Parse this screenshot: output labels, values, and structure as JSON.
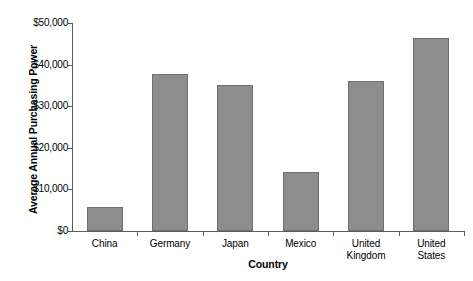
{
  "chart_data": {
    "type": "bar",
    "title": "",
    "subtitle": "",
    "xlabel": "Country",
    "ylabel": "Average Annual Purchasing Power",
    "categories": [
      "China",
      "Germany",
      "Japan",
      "Mexico",
      "United Kingdom",
      "United States"
    ],
    "values": [
      5800,
      37700,
      35000,
      14200,
      36000,
      46500
    ],
    "ylim": [
      0,
      50000
    ],
    "ytick_values": [
      0,
      10000,
      20000,
      30000,
      40000,
      50000
    ],
    "ytick_labels": [
      "$0",
      "$10,000",
      "$20,000",
      "$30,000",
      "$40,000",
      "$50,000"
    ],
    "grid": false,
    "legend": false,
    "legend_position": "none",
    "bar_color": "#8d8d8d",
    "bar_border_color": "#6f6f6f",
    "axis_color": "#5c5c5c",
    "background_color": "#ffffff",
    "category_labels_wrapped": [
      [
        "China"
      ],
      [
        "Germany"
      ],
      [
        "Japan"
      ],
      [
        "Mexico"
      ],
      [
        "United",
        "Kingdom"
      ],
      [
        "United",
        "States"
      ]
    ]
  }
}
